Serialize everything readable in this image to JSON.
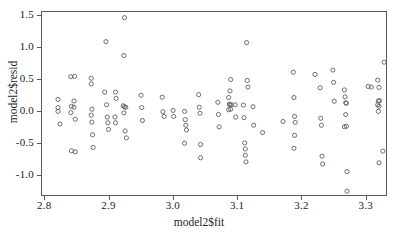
{
  "chart_data": {
    "type": "scatter",
    "title": "",
    "xlabel": "model2$fit",
    "ylabel": "model2$resid",
    "xlim": [
      2.795,
      3.333
    ],
    "ylim": [
      -1.33,
      1.57
    ],
    "xticks": [
      "2.8",
      "2.9",
      "3.0",
      "3.1",
      "3.2",
      "3.3"
    ],
    "xtick_values": [
      2.8,
      2.9,
      3.0,
      3.1,
      3.2,
      3.3
    ],
    "yticks": [
      "1.5",
      "1.0",
      "0.5",
      "0.0",
      "-0.5",
      "-1.0"
    ],
    "ytick_values": [
      1.5,
      1.0,
      0.5,
      0.0,
      -0.5,
      -1.0
    ],
    "grid": false,
    "legend": null,
    "marker": "open-circle",
    "marker_color": "#5a5f64",
    "marker_radius": 2.1,
    "points": [
      [
        2.82,
        0.185
      ],
      [
        2.82,
        0.055
      ],
      [
        2.82,
        -0.005
      ],
      [
        2.823,
        -0.205
      ],
      [
        2.84,
        0.545
      ],
      [
        2.846,
        0.55
      ],
      [
        2.841,
        0.075
      ],
      [
        2.845,
        0.16
      ],
      [
        2.845,
        0.06
      ],
      [
        2.84,
        -0.025
      ],
      [
        2.847,
        -0.13
      ],
      [
        2.841,
        -0.63
      ],
      [
        2.847,
        -0.645
      ],
      [
        2.872,
        0.52
      ],
      [
        2.872,
        0.43
      ],
      [
        2.873,
        0.03
      ],
      [
        2.872,
        -0.065
      ],
      [
        2.873,
        -0.175
      ],
      [
        2.874,
        -0.375
      ],
      [
        2.875,
        -0.575
      ],
      [
        2.893,
        0.3
      ],
      [
        2.895,
        1.1
      ],
      [
        2.896,
        0.1
      ],
      [
        2.897,
        -0.095
      ],
      [
        2.898,
        -0.185
      ],
      [
        2.899,
        -0.29
      ],
      [
        2.91,
        0.3
      ],
      [
        2.911,
        0.2
      ],
      [
        2.909,
        -0.095
      ],
      [
        2.91,
        -0.185
      ],
      [
        2.924,
        1.48
      ],
      [
        2.923,
        0.88
      ],
      [
        2.922,
        0.085
      ],
      [
        2.924,
        0.07
      ],
      [
        2.926,
        0.06
      ],
      [
        2.923,
        -0.03
      ],
      [
        2.925,
        -0.315
      ],
      [
        2.927,
        -0.425
      ],
      [
        2.95,
        0.25
      ],
      [
        2.951,
        0.055
      ],
      [
        2.952,
        -0.15
      ],
      [
        2.983,
        0.22
      ],
      [
        2.984,
        -0.01
      ],
      [
        2.986,
        -0.085
      ],
      [
        3.0,
        0.01
      ],
      [
        3.001,
        -0.085
      ],
      [
        3.018,
        -0.005
      ],
      [
        3.019,
        -0.135
      ],
      [
        3.02,
        -0.225
      ],
      [
        3.021,
        -0.3
      ],
      [
        3.018,
        -0.51
      ],
      [
        3.04,
        0.26
      ],
      [
        3.041,
        0.06
      ],
      [
        3.042,
        -0.035
      ],
      [
        3.043,
        -0.53
      ],
      [
        3.043,
        -0.74
      ],
      [
        3.07,
        0.14
      ],
      [
        3.071,
        -0.055
      ],
      [
        3.072,
        -0.25
      ],
      [
        3.087,
        0.215
      ],
      [
        3.089,
        0.32
      ],
      [
        3.088,
        0.11
      ],
      [
        3.089,
        0.095
      ],
      [
        3.091,
        0.1
      ],
      [
        3.087,
        0.02
      ],
      [
        3.09,
        0.03
      ],
      [
        3.09,
        0.5
      ],
      [
        3.097,
        0.1
      ],
      [
        3.098,
        -0.095
      ],
      [
        3.11,
        0.095
      ],
      [
        3.111,
        -0.105
      ],
      [
        3.112,
        -0.505
      ],
      [
        3.113,
        -0.6
      ],
      [
        3.113,
        -0.7
      ],
      [
        3.114,
        -0.805
      ],
      [
        3.115,
        1.085
      ],
      [
        3.116,
        0.485
      ],
      [
        3.117,
        0.38
      ],
      [
        3.125,
        0.07
      ],
      [
        3.126,
        -0.225
      ],
      [
        3.14,
        -0.34
      ],
      [
        3.172,
        -0.165
      ],
      [
        3.188,
        0.615
      ],
      [
        3.189,
        0.215
      ],
      [
        3.19,
        -0.085
      ],
      [
        3.191,
        -0.18
      ],
      [
        3.19,
        -0.385
      ],
      [
        3.189,
        -0.59
      ],
      [
        3.222,
        0.58
      ],
      [
        3.23,
        0.37
      ],
      [
        3.231,
        -0.115
      ],
      [
        3.232,
        -0.225
      ],
      [
        3.233,
        -0.715
      ],
      [
        3.234,
        -0.84
      ],
      [
        3.25,
        0.65
      ],
      [
        3.251,
        0.455
      ],
      [
        3.252,
        0.155
      ],
      [
        3.268,
        0.335
      ],
      [
        3.269,
        0.225
      ],
      [
        3.27,
        0.13
      ],
      [
        3.271,
        0.125
      ],
      [
        3.27,
        -0.055
      ],
      [
        3.271,
        -0.24
      ],
      [
        3.268,
        -0.25
      ],
      [
        3.272,
        -0.96
      ],
      [
        3.272,
        -1.27
      ],
      [
        3.305,
        0.39
      ],
      [
        3.31,
        0.38
      ],
      [
        3.32,
        0.49
      ],
      [
        3.322,
        0.375
      ],
      [
        3.321,
        0.16
      ],
      [
        3.323,
        0.165
      ],
      [
        3.32,
        0.1
      ],
      [
        3.322,
        0.075
      ],
      [
        3.321,
        -0.005
      ],
      [
        3.33,
        0.775
      ],
      [
        3.328,
        -0.635
      ],
      [
        3.322,
        -0.82
      ]
    ]
  },
  "axes": {
    "frame_color": "#555a5e"
  }
}
